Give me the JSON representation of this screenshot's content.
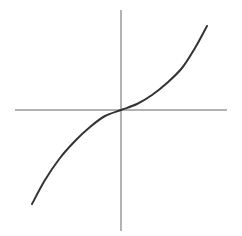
{
  "chart_data": {
    "type": "line",
    "title": "",
    "xlabel": "",
    "ylabel": "",
    "function": "y = x^3",
    "grid": false,
    "legend": null,
    "axes": {
      "origin_px": [
        121,
        110
      ],
      "x_axis_px": {
        "x1": 15,
        "x2": 227,
        "y": 110
      },
      "y_axis_px": {
        "x": 121,
        "y1": 10,
        "y2": 231
      }
    },
    "series": [
      {
        "name": "curve",
        "points_px": [
          [
            32,
            204
          ],
          [
            45,
            180
          ],
          [
            60,
            158
          ],
          [
            75,
            141
          ],
          [
            90,
            127
          ],
          [
            105,
            116
          ],
          [
            121,
            110
          ],
          [
            137,
            104
          ],
          [
            152,
            95
          ],
          [
            167,
            83
          ],
          [
            182,
            68
          ],
          [
            195,
            48
          ],
          [
            207,
            26
          ]
        ]
      }
    ],
    "colors": {
      "axis": "#666666",
      "curve": "#333333",
      "background": "#ffffff"
    }
  }
}
